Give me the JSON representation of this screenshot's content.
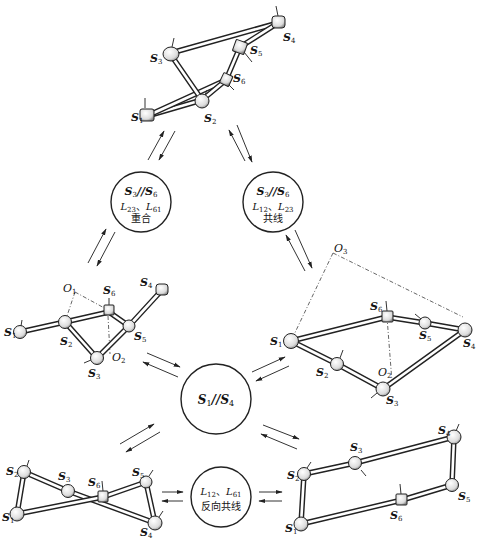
{
  "diagram": {
    "conditions": {
      "top_left": {
        "parallel": {
          "a": "S",
          "a_sub": "3",
          "sep": "//",
          "b": "S",
          "b_sub": "6"
        },
        "line2": {
          "a": "L",
          "a_sub": "23",
          "sep": "、",
          "b": "L",
          "b_sub": "61"
        },
        "line3": "重合"
      },
      "top_right": {
        "parallel": {
          "a": "S",
          "a_sub": "3",
          "sep": "//",
          "b": "S",
          "b_sub": "6"
        },
        "line2": {
          "a": "L",
          "a_sub": "12",
          "sep": "、",
          "b": "L",
          "b_sub": "23"
        },
        "line3": "共线"
      },
      "center": {
        "parallel": {
          "a": "S",
          "a_sub": "1",
          "sep": "//",
          "b": "S",
          "b_sub": "4"
        }
      },
      "bottom": {
        "line2": {
          "a": "L",
          "a_sub": "12",
          "sep": "、",
          "b": "L",
          "b_sub": "61"
        },
        "line3": "反向共线"
      }
    },
    "mechanisms": {
      "top": {
        "joints": [
          "S1",
          "S2",
          "S3",
          "S4",
          "S5",
          "S6"
        ]
      },
      "middle_left": {
        "joints": [
          "S1",
          "S2",
          "S3",
          "S4",
          "S5",
          "S6"
        ],
        "points": [
          "O1",
          "O2"
        ]
      },
      "middle_right": {
        "joints": [
          "S1",
          "S2",
          "S3",
          "S4",
          "S5",
          "S6"
        ],
        "points": [
          "O2",
          "O3"
        ]
      },
      "bottom_left": {
        "joints": [
          "S1",
          "S2",
          "S3",
          "S4",
          "S5",
          "S6"
        ]
      },
      "bottom_right": {
        "joints": [
          "S1",
          "S2",
          "S3",
          "S4",
          "S5",
          "S6"
        ]
      }
    },
    "labels": {
      "S": "S",
      "O": "O",
      "n1": "1",
      "n2": "2",
      "n3": "3",
      "n4": "4",
      "n5": "5",
      "n6": "6"
    }
  }
}
